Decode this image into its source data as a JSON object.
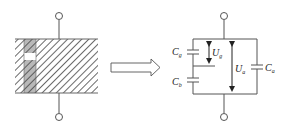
{
  "diagram": {
    "type": "physical-to-equivalent-circuit",
    "left_panel": {
      "description": "hatched dielectric block with darker vertical stripe containing a void (gap)",
      "terminals": [
        "top-terminal",
        "bottom-terminal"
      ]
    },
    "arrow": {
      "direction": "right",
      "meaning": "equivalent to"
    },
    "right_panel": {
      "components": [
        {
          "id": "Cg",
          "symbol": "C",
          "subscript": "g"
        },
        {
          "id": "Cb",
          "symbol": "C",
          "subscript": "b"
        },
        {
          "id": "Ca",
          "symbol": "C",
          "subscript": "a"
        }
      ],
      "voltages": [
        {
          "id": "Ug",
          "symbol": "U",
          "subscript": "g"
        },
        {
          "id": "Ua",
          "symbol": "U",
          "subscript": "a"
        }
      ]
    },
    "labels": {
      "cg_main": "C",
      "cg_sub": "g",
      "cb_main": "C",
      "cb_sub": "b",
      "ca_main": "C",
      "ca_sub": "a",
      "ug_main": "U",
      "ug_sub": "g",
      "ua_main": "U",
      "ua_sub": "a"
    },
    "colors": {
      "line": "#555555",
      "hatch": "#444444",
      "stripe_fill": "#b8b8b8",
      "void_fill": "#ffffff"
    }
  }
}
